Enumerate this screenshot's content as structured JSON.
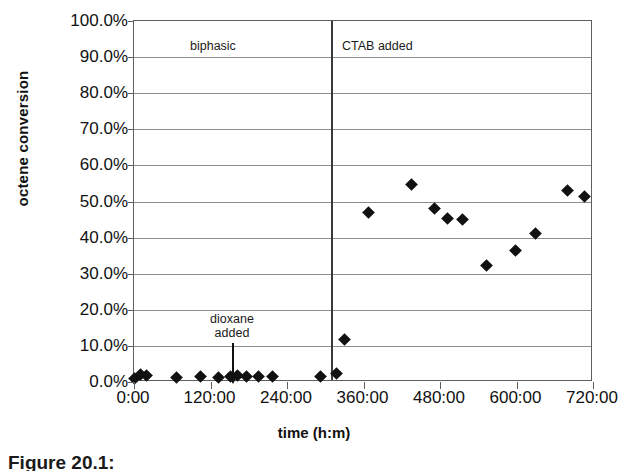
{
  "chart_data": {
    "type": "scatter",
    "title": "",
    "xlabel": "time (h:m)",
    "ylabel": "octene conversion",
    "xlim": [
      0,
      720
    ],
    "ylim": [
      0,
      1.0
    ],
    "grid": true,
    "legend": "none",
    "x_ticklabels": [
      "0:00",
      "120:00",
      "240:00",
      "360:00",
      "480:00",
      "600:00",
      "720:00"
    ],
    "x_tickvalues": [
      0,
      120,
      240,
      360,
      480,
      600,
      720
    ],
    "y_ticklabels": [
      "0.0%",
      "10.0%",
      "20.0%",
      "30.0%",
      "40.0%",
      "50.0%",
      "60.0%",
      "70.0%",
      "80.0%",
      "90.0%",
      "100.0%"
    ],
    "y_tickvalues": [
      0,
      10,
      20,
      30,
      40,
      50,
      60,
      70,
      80,
      90,
      100
    ],
    "series": [
      {
        "name": "octene conversion",
        "marker": "diamond",
        "color": "#111111",
        "points": [
          {
            "x": 0,
            "y": 1.0
          },
          {
            "x": 10,
            "y": 2.0
          },
          {
            "x": 20,
            "y": 1.8
          },
          {
            "x": 66,
            "y": 1.3
          },
          {
            "x": 105,
            "y": 1.5
          },
          {
            "x": 132,
            "y": 1.2
          },
          {
            "x": 152,
            "y": 1.6
          },
          {
            "x": 162,
            "y": 1.9
          },
          {
            "x": 176,
            "y": 1.4
          },
          {
            "x": 196,
            "y": 1.5
          },
          {
            "x": 218,
            "y": 1.6
          },
          {
            "x": 293,
            "y": 1.4
          },
          {
            "x": 317,
            "y": 2.3
          },
          {
            "x": 330,
            "y": 11.7
          },
          {
            "x": 368,
            "y": 47.0
          },
          {
            "x": 435,
            "y": 54.8
          },
          {
            "x": 472,
            "y": 48.0
          },
          {
            "x": 492,
            "y": 45.3
          },
          {
            "x": 516,
            "y": 44.9
          },
          {
            "x": 553,
            "y": 32.2
          },
          {
            "x": 598,
            "y": 36.5
          },
          {
            "x": 630,
            "y": 41.2
          },
          {
            "x": 680,
            "y": 53.0
          },
          {
            "x": 706,
            "y": 51.3
          }
        ]
      }
    ],
    "annotations": [
      {
        "name": "biphasic-label",
        "text": "biphasic",
        "x": 150,
        "y": 95
      },
      {
        "name": "ctab-label",
        "text": "CTAB added",
        "x": 335,
        "y": 95
      },
      {
        "name": "dioxane-label-line1",
        "text": "dioxane",
        "x": 155,
        "y": 24
      },
      {
        "name": "dioxane-label-line2",
        "text": "added",
        "x": 155,
        "y": 19
      },
      {
        "name": "ctab-divider-line",
        "text": "",
        "x": 322,
        "y": 0
      }
    ]
  },
  "labels": {
    "ylabel": "octene conversion",
    "xlabel": "time (h:m)",
    "biphasic": "biphasic",
    "ctab_added": "CTAB added",
    "dioxane_line1": "dioxane",
    "dioxane_line2": "added"
  },
  "caption": {
    "text": "Figure 20.1:"
  }
}
